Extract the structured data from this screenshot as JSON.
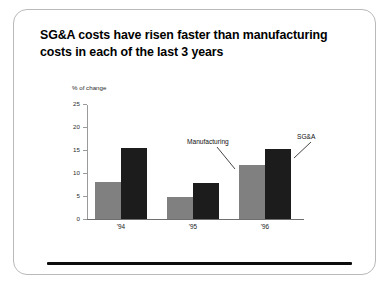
{
  "slide": {
    "title_line_1": "SG&A costs have risen faster than manufacturing",
    "title_line_2": "costs in each of the last 3 years"
  },
  "annotations": {
    "manufacturing_label": "Manufacturing",
    "sga_label": "SG&A"
  },
  "colors": {
    "manufacturing_bar": "#808080",
    "sga_bar": "#1c1c1c",
    "axis": "#9a9a9a",
    "title_text": "#000000",
    "rule": "#0d0d0d"
  },
  "chart_data": {
    "type": "bar",
    "title": "SG&A costs have risen faster than manufacturing costs in each of the last 3 years",
    "xlabel": "",
    "ylabel": "% of change",
    "categories": [
      "'94",
      "'95",
      "'96"
    ],
    "series": [
      {
        "name": "Manufacturing",
        "values": [
          8.0,
          4.7,
          11.8
        ]
      },
      {
        "name": "SG&A",
        "values": [
          15.5,
          7.8,
          15.3
        ]
      }
    ],
    "ylim": [
      0,
      25
    ],
    "yticks": [
      0,
      5,
      10,
      15,
      20,
      25
    ],
    "ytick_labels": [
      "0",
      "5",
      "10",
      "15",
      "20",
      "25"
    ],
    "grid": false,
    "legend": "callout-annotations"
  }
}
